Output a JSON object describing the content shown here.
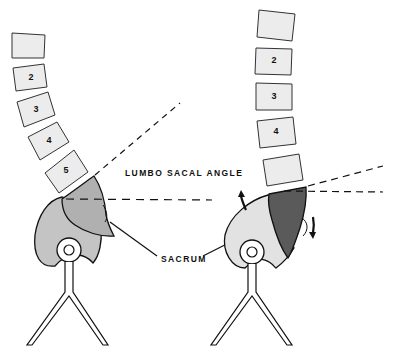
{
  "diagram": {
    "labels": {
      "lumbo_sacal_angle": "LUMBO SACAL ANGLE",
      "sacrum": "SACRUM"
    },
    "left_figure": {
      "vertebrae": [
        "",
        "2",
        "3",
        "4",
        "5"
      ],
      "pelvis_fill": "#c4c4c4",
      "sacrum_fill": "#b0b0b0"
    },
    "right_figure": {
      "vertebrae": [
        "",
        "2",
        "3",
        "4",
        ""
      ],
      "pelvis_fill": "#e2e2e2",
      "sacrum_fill": "#5a5a5a"
    },
    "colors": {
      "vertebra_fill": "#ececec",
      "stroke": "#111111"
    }
  }
}
